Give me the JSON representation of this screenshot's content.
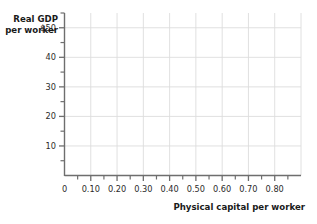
{
  "chart_data": {
    "type": "line",
    "title": "",
    "subtitle": "",
    "xlabel": "Physical capital per worker",
    "ylabel_line1": "Real GDP",
    "ylabel_line2": "per worker",
    "ylabel": "Real GDP per worker",
    "xlim": [
      0,
      0.9
    ],
    "ylim": [
      0,
      55
    ],
    "grid": true,
    "legend": null,
    "series": [],
    "annotations": [],
    "note": "empty plot grid, no data plotted",
    "x_ticks_major": [
      {
        "value": 0,
        "label": "0"
      },
      {
        "value": 0.1,
        "label": "0.10"
      },
      {
        "value": 0.2,
        "label": "0.20"
      },
      {
        "value": 0.3,
        "label": "0.30"
      },
      {
        "value": 0.4,
        "label": "0.40"
      },
      {
        "value": 0.5,
        "label": "0.50"
      },
      {
        "value": 0.6,
        "label": "0.60"
      },
      {
        "value": 0.7,
        "label": "0.70"
      },
      {
        "value": 0.8,
        "label": "0.80"
      }
    ],
    "x_ticks_minor": [
      0.05,
      0.15,
      0.25,
      0.35,
      0.45,
      0.55,
      0.65,
      0.75,
      0.85
    ],
    "y_ticks_major": [
      {
        "value": 50,
        "label": "$50"
      },
      {
        "value": 40,
        "label": "40"
      },
      {
        "value": 30,
        "label": "30"
      },
      {
        "value": 20,
        "label": "20"
      },
      {
        "value": 10,
        "label": "10"
      }
    ],
    "y_ticks_minor": [
      55,
      45,
      35,
      25,
      15,
      5
    ]
  },
  "colors": {
    "background": "#ffffff",
    "axis": "#6e6e6e",
    "gridline": "#dcdcdc",
    "text": "#1a1a1a",
    "tick_text": "#2b2b2b"
  }
}
